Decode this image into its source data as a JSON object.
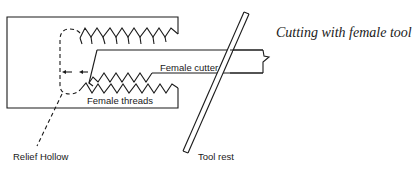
{
  "diagram": {
    "title": "Cutting with female tool",
    "labels": {
      "female_cutter": "Female cutter",
      "female_threads": "Female threads",
      "relief_hollow": "Relief Hollow",
      "tool_rest": "Tool rest"
    },
    "colors": {
      "line": "#1a1a1a",
      "background": "#ffffff"
    }
  }
}
